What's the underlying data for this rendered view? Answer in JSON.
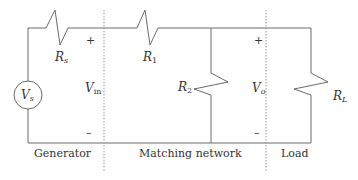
{
  "diagram": {
    "type": "circuit",
    "source": {
      "label": "V",
      "subscript": "s"
    },
    "resistors": [
      {
        "id": "Rs",
        "label": "R",
        "subscript": "s"
      },
      {
        "id": "R1",
        "label": "R",
        "subscript": "1"
      },
      {
        "id": "R2",
        "label": "R",
        "subscript": "2"
      },
      {
        "id": "RL",
        "label": "R",
        "subscript": "L"
      }
    ],
    "voltages": [
      {
        "id": "Vin",
        "label": "V",
        "subscript": "in",
        "plus": "+",
        "minus": "–"
      },
      {
        "id": "Vo",
        "label": "V",
        "subscript": "o",
        "plus": "+",
        "minus": "–"
      }
    ],
    "sections": [
      {
        "id": "generator",
        "label": "Generator"
      },
      {
        "id": "matching",
        "label": "Matching network"
      },
      {
        "id": "load",
        "label": "Load"
      }
    ],
    "colors": {
      "wire": "#6a6a6a",
      "divider": "#9a9a9a",
      "text": "#333333"
    }
  }
}
